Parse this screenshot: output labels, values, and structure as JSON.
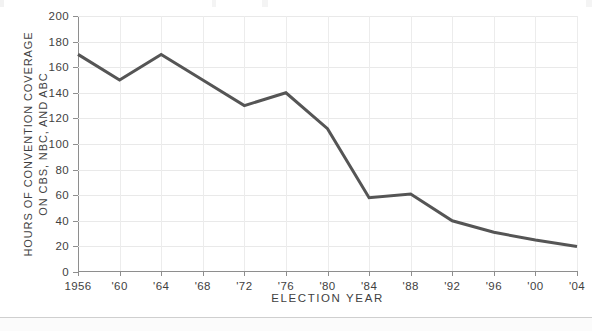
{
  "chart_data": {
    "type": "line",
    "title": "",
    "xlabel": "ELECTION YEAR",
    "ylabel": "HOURS OF CONVENTION COVERAGE ON CBS, NBC, AND ABC",
    "ylabel_lines": [
      "HOURS OF CONVENTION COVERAGE",
      "ON CBS, NBC, AND ABC"
    ],
    "categories": [
      "1956",
      "'60",
      "'64",
      "'68",
      "'72",
      "'76",
      "'80",
      "'84",
      "'88",
      "'92",
      "'96",
      "'00",
      "'04"
    ],
    "x": [
      1956,
      1960,
      1964,
      1968,
      1972,
      1976,
      1980,
      1984,
      1988,
      1992,
      1996,
      2000,
      2004
    ],
    "values": [
      170,
      150,
      170,
      150,
      130,
      140,
      112,
      58,
      61,
      40,
      31,
      25,
      20
    ],
    "series": [
      {
        "name": "Hours of convention coverage on CBS, NBC, and ABC",
        "values": [
          170,
          150,
          170,
          150,
          130,
          140,
          112,
          58,
          61,
          40,
          31,
          25,
          20
        ],
        "color": "#555555"
      }
    ],
    "xlim": [
      1956,
      2004
    ],
    "ylim": [
      0,
      200
    ],
    "ytick_labels": [
      "200",
      "180",
      "160",
      "140",
      "120",
      "100",
      "80",
      "60",
      "40",
      "20",
      "0"
    ],
    "yticks": [
      200,
      180,
      160,
      140,
      120,
      100,
      80,
      60,
      40,
      20,
      0
    ],
    "ytick_step": 20,
    "grid": "both-light",
    "legend": "none",
    "line_color": "#555555",
    "grid_color": "#e9e9e9",
    "axis_color": "#8e8e8e",
    "background": "#ffffff",
    "markers": "none",
    "line_width": 3
  }
}
